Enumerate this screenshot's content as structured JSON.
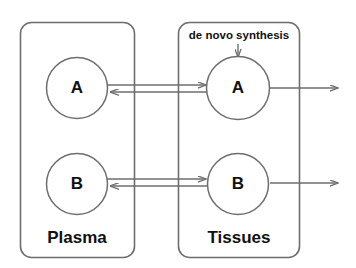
{
  "diagram": {
    "type": "compartment-flux-diagram",
    "background_color": "#ffffff",
    "stroke_color": "#6e6e6e",
    "text_color": "#111111",
    "compartments": [
      {
        "id": "plasma",
        "label": "Plasma",
        "nodes": [
          {
            "id": "plasma-a",
            "label": "A"
          },
          {
            "id": "plasma-b",
            "label": "B"
          }
        ]
      },
      {
        "id": "tissues",
        "label": "Tissues",
        "nodes": [
          {
            "id": "tissues-a",
            "label": "A"
          },
          {
            "id": "tissues-b",
            "label": "B"
          }
        ]
      }
    ],
    "annotations": [
      {
        "id": "de-novo-synthesis",
        "label": "de novo  synthesis"
      }
    ],
    "flows": [
      {
        "id": "a-plasma-to-tissues",
        "from": "plasma-a",
        "to": "tissues-a",
        "direction": "right"
      },
      {
        "id": "a-tissues-to-plasma",
        "from": "tissues-a",
        "to": "plasma-a",
        "direction": "left"
      },
      {
        "id": "b-plasma-to-tissues",
        "from": "plasma-b",
        "to": "tissues-b",
        "direction": "right"
      },
      {
        "id": "b-tissues-to-plasma",
        "from": "tissues-b",
        "to": "plasma-b",
        "direction": "left"
      },
      {
        "id": "a-tissues-outflow",
        "from": "tissues-a",
        "to": "external",
        "direction": "right"
      },
      {
        "id": "b-tissues-outflow",
        "from": "tissues-b",
        "to": "external",
        "direction": "right"
      },
      {
        "id": "synthesis-inflow",
        "from": "de-novo-synthesis",
        "to": "tissues-a",
        "direction": "down"
      }
    ]
  }
}
